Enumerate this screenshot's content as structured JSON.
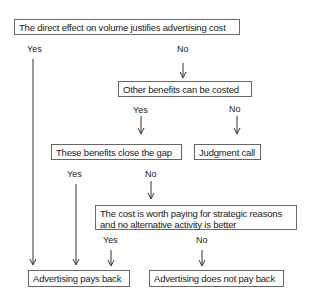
{
  "diagram": {
    "nodes": {
      "n1": "The direct effect on volume justifies advertising cost",
      "n2": "Other benefits can be costed",
      "n3": "These benefits close the gap",
      "n4": "Judgment call",
      "n5_line1": "The cost is worth paying for strategic reasons",
      "n5_line2": "and no alternative activity is better",
      "n6": "Advertising pays back",
      "n7": "Advertising does not pay back"
    },
    "labels": {
      "n1_yes": "Yes",
      "n1_no": "No",
      "n2_yes": "Yes",
      "n2_no": "No",
      "n3_yes": "Yes",
      "n3_no": "No",
      "n5_yes": "Yes",
      "n5_no": "No"
    },
    "colors": {
      "line": "#333333",
      "border": "#666666",
      "text": "#222222"
    }
  }
}
